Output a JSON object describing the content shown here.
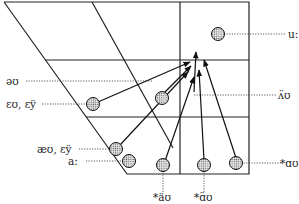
{
  "diagram": {
    "vowels": [
      {
        "id": "u",
        "label": "u:",
        "label_side": "right"
      },
      {
        "id": "schwa_u",
        "label": "əʊ",
        "label_side": "left"
      },
      {
        "id": "au_high",
        "label": "ʌ̈ʊ",
        "label_side": "right"
      },
      {
        "id": "eu",
        "label": "ɛʊ, ɛÿ",
        "label_side": "left"
      },
      {
        "id": "ae",
        "label": "æʊ, ɛÿ",
        "label_side": "left"
      },
      {
        "id": "a_long",
        "label": "a:",
        "label_side": "left"
      },
      {
        "id": "star_au1",
        "label": "*äʊ",
        "label_side": "below"
      },
      {
        "id": "star_au2",
        "label": "*ɑ̈ʊ",
        "label_side": "below"
      },
      {
        "id": "star_au3",
        "label": "*ɑʊ",
        "label_side": "right"
      }
    ],
    "arrows": [
      {
        "from": "eu",
        "to": "target"
      },
      {
        "from": "schwa_u",
        "to": "target"
      },
      {
        "from": "ae",
        "to": "target"
      },
      {
        "from": "star_au1",
        "to": "target"
      },
      {
        "from": "star_au2",
        "to": "target"
      },
      {
        "from": "star_au3",
        "to": "target"
      },
      {
        "from": "au_high",
        "to": "target"
      }
    ],
    "colors": {
      "line": "#222222",
      "dot_fill": "#bdbdbd",
      "background": "#ffffff"
    }
  }
}
